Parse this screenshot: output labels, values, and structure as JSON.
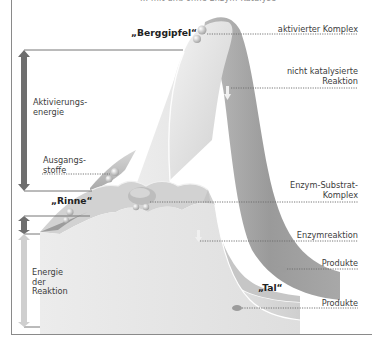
{
  "title_cut": "... mit und ohne Enzym-Katalyse",
  "landmarks": {
    "peak": "„Berggipfel“",
    "groove": "„Rinne“",
    "valley": "„Tal“"
  },
  "left_labels": {
    "activation_energy": [
      "Aktivierungs-",
      "energie"
    ],
    "starting_materials": [
      "Ausgangs-",
      "stoffe"
    ],
    "reaction_energy": [
      "Energie",
      "der",
      "Reaktion"
    ]
  },
  "right_labels": {
    "activated_complex": "aktivierter Komplex",
    "uncatalyzed": [
      "nicht katalysierte",
      "Reaktion"
    ],
    "enzyme_substrate_complex": [
      "Enzym-Substrat-",
      "Komplex"
    ],
    "enzyme_reaction": "Enzymreaktion",
    "products_1": "Produkte",
    "products_2": "Produkte"
  },
  "colors": {
    "surface_light": "#e6e6e6",
    "surface_mid": "#c4c4c4",
    "surface_dark": "#8e8e8e",
    "arrow_dark": "#6e6e6e",
    "arrow_light": "#cfcfcf",
    "frame": "#8a8a8a"
  }
}
